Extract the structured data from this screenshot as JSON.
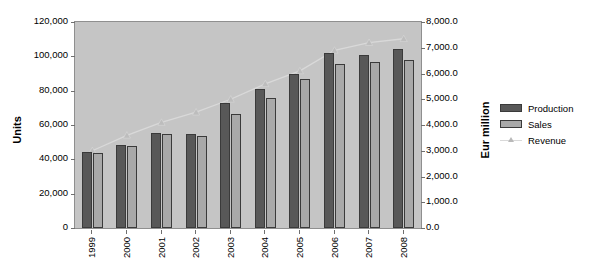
{
  "chart_data": {
    "type": "bar",
    "title": "",
    "subtitle": "",
    "xlabel": "",
    "ylabel": "Units",
    "y2label": "Eur million",
    "grid": false,
    "legend_position": "right",
    "categories": [
      "1999",
      "2000",
      "2001",
      "2002",
      "2003",
      "2004",
      "2005",
      "2006",
      "2007",
      "2008"
    ],
    "ylim": [
      0,
      120000
    ],
    "y2lim": [
      0,
      8000
    ],
    "yticks": [
      0,
      20000,
      40000,
      60000,
      80000,
      100000,
      120000
    ],
    "ytick_labels": [
      "0",
      "20,000",
      "40,000",
      "60,000",
      "80,000",
      "100,000",
      "120,000"
    ],
    "y2ticks": [
      0,
      1000,
      2000,
      3000,
      4000,
      5000,
      6000,
      7000,
      8000
    ],
    "y2tick_labels": [
      "0.0",
      "1,000.0",
      "2,000.0",
      "3,000.0",
      "4,000.0",
      "5,000.0",
      "6,000.0",
      "7,000.0",
      "8,000.0"
    ],
    "series": [
      {
        "name": "Production",
        "kind": "bar",
        "axis": "left",
        "color": "#585858",
        "values": [
          44500,
          48500,
          55500,
          54500,
          73000,
          81000,
          89500,
          102000,
          100500,
          104500
        ]
      },
      {
        "name": "Sales",
        "kind": "bar",
        "axis": "left",
        "color": "#a9a9a9",
        "values": [
          43500,
          48000,
          54500,
          53500,
          66500,
          76000,
          87000,
          95500,
          96500,
          98000
        ]
      },
      {
        "name": "Revenue",
        "kind": "line",
        "axis": "right",
        "color": "#d9d9d9",
        "marker": "triangle",
        "values": [
          3000,
          3600,
          4100,
          4500,
          5000,
          5600,
          6100,
          6900,
          7200,
          7350
        ]
      }
    ]
  },
  "legend": {
    "items": [
      {
        "label": "Production",
        "type": "swatch-dark"
      },
      {
        "label": "Sales",
        "type": "swatch-light"
      },
      {
        "label": "Revenue",
        "type": "line-marker"
      }
    ]
  },
  "colors": {
    "plot_background": "#c5c5c5",
    "page_background": "#ffffff",
    "production": "#585858",
    "sales": "#a9a9a9",
    "revenue": "#d9d9d9",
    "axis": "#6f6f6f",
    "text": "#000000"
  }
}
